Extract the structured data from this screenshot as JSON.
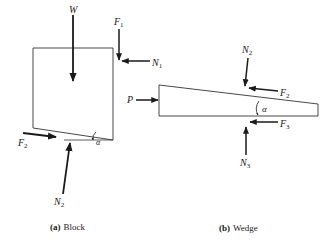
{
  "diagram": {
    "block": {
      "caption_tag": "(a)",
      "caption_text": "Block",
      "forces": {
        "W": {
          "main": "W",
          "sub": ""
        },
        "F1": {
          "main": "F",
          "sub": "1"
        },
        "N1": {
          "main": "N",
          "sub": "1"
        },
        "F2": {
          "main": "F",
          "sub": "2"
        },
        "N2": {
          "main": "N",
          "sub": "2"
        }
      },
      "angle": "α"
    },
    "wedge": {
      "caption_tag": "(b)",
      "caption_text": "Wedge",
      "forces": {
        "P": {
          "main": "P",
          "sub": ""
        },
        "N2": {
          "main": "N",
          "sub": "2"
        },
        "F2": {
          "main": "F",
          "sub": "2"
        },
        "F3": {
          "main": "F",
          "sub": "3"
        },
        "N3": {
          "main": "N",
          "sub": "3"
        }
      },
      "angle": "α"
    },
    "colors": {
      "stroke": "#1a1a1a",
      "background": "#ffffff"
    }
  }
}
